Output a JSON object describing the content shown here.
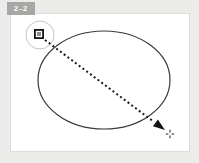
{
  "figure": {
    "badge_label": "2-2"
  },
  "icons": {
    "node_handle": "square-node-handle",
    "cursor": "precision-crosshair",
    "arrow": "solid-arrowhead"
  },
  "colors": {
    "frame_bg": "#ececea",
    "panel_bg": "#ffffff",
    "panel_border": "#dcdcd9",
    "badge_bg": "#a7a7a5",
    "badge_text": "#ffffff",
    "ellipse_stroke": "#3a3a3a",
    "guide_circle_stroke": "#c4c4c2",
    "handle_outline": "#161616",
    "handle_fill": "#8e8e8e",
    "drag_line": "#1a1a1a",
    "arrowhead_fill": "#161616",
    "crosshair": "#2a2a2a"
  }
}
